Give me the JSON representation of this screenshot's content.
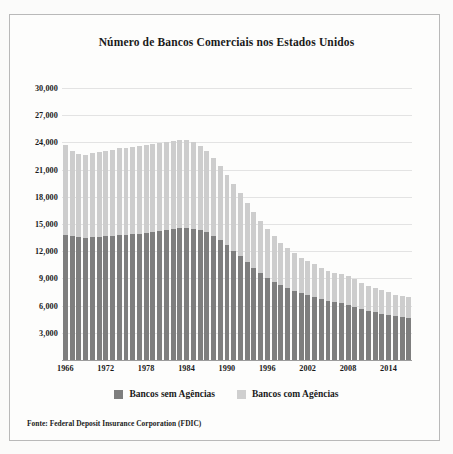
{
  "chart_data": {
    "type": "bar",
    "stacked": true,
    "title": "Número de Bancos Comerciais nos Estados Unidos",
    "xlabel": "",
    "ylabel": "",
    "ylim": [
      0,
      30000
    ],
    "ytick_labels": [
      "30,000",
      "27,000",
      "24,000",
      "21,000",
      "18,000",
      "15,000",
      "12,000",
      "9,000",
      "6,000",
      "3,000"
    ],
    "ytick_values": [
      30000,
      27000,
      24000,
      21000,
      18000,
      15000,
      12000,
      9000,
      6000,
      3000
    ],
    "xtick_labels": [
      "1966",
      "1972",
      "1978",
      "1984",
      "1990",
      "1996",
      "2002",
      "2008",
      "2014"
    ],
    "xtick_values": [
      1966,
      1972,
      1978,
      1984,
      1990,
      1996,
      2002,
      2008,
      2014
    ],
    "grid": true,
    "legend_position": "bottom",
    "categories": [
      1966,
      1967,
      1968,
      1969,
      1970,
      1971,
      1972,
      1973,
      1974,
      1975,
      1976,
      1977,
      1978,
      1979,
      1980,
      1981,
      1982,
      1983,
      1984,
      1985,
      1986,
      1987,
      1988,
      1989,
      1990,
      1991,
      1992,
      1993,
      1994,
      1995,
      1996,
      1997,
      1998,
      1999,
      2000,
      2001,
      2002,
      2003,
      2004,
      2005,
      2006,
      2007,
      2008,
      2009,
      2010,
      2011,
      2012,
      2013,
      2014,
      2015,
      2016,
      2017
    ],
    "series": [
      {
        "name": "Bancos sem Agências",
        "color": "#7e7e7e",
        "values": [
          13800,
          13650,
          13550,
          13500,
          13550,
          13600,
          13650,
          13700,
          13750,
          13800,
          13850,
          13900,
          14000,
          14100,
          14200,
          14300,
          14450,
          14550,
          14600,
          14500,
          14350,
          14100,
          13700,
          13200,
          12650,
          12050,
          11450,
          10800,
          10200,
          9600,
          9100,
          8650,
          8250,
          7900,
          7600,
          7350,
          7150,
          6950,
          6750,
          6550,
          6400,
          6250,
          6100,
          5850,
          5600,
          5400,
          5250,
          5100,
          4950,
          4800,
          4700,
          4600
        ]
      },
      {
        "name": "Bancos com Agências",
        "color": "#cdcdcd",
        "values": [
          9900,
          9450,
          9200,
          9150,
          9250,
          9350,
          9450,
          9500,
          9600,
          9600,
          9700,
          9750,
          9750,
          9700,
          9700,
          9750,
          9750,
          9750,
          9700,
          9500,
          9300,
          9000,
          8600,
          8200,
          7800,
          7400,
          7000,
          6550,
          6100,
          5750,
          5350,
          5000,
          4700,
          4400,
          4150,
          3950,
          3750,
          3600,
          3450,
          3300,
          3250,
          3200,
          3150,
          3050,
          2900,
          2800,
          2700,
          2600,
          2500,
          2400,
          2350,
          2300
        ]
      }
    ],
    "totals": [
      23700,
      23100,
      22750,
      22650,
      22800,
      22950,
      23100,
      23200,
      23350,
      23400,
      23550,
      23650,
      23750,
      23800,
      23900,
      24050,
      24200,
      24300,
      24300,
      24000,
      23650,
      23100,
      22300,
      21400,
      20450,
      19450,
      18450,
      17350,
      16300,
      15350,
      14450,
      13650,
      12950,
      12300,
      11750,
      11300,
      10900,
      10550,
      10200,
      9850,
      9650,
      9450,
      9250,
      8900,
      8500,
      8200,
      7950,
      7700,
      7450,
      7200,
      7050,
      6900
    ]
  },
  "legend": {
    "items": [
      {
        "label": "Bancos sem Agências",
        "swatch": "dark"
      },
      {
        "label": "Bancos com Agências",
        "swatch": "light"
      }
    ]
  },
  "source": {
    "text": "Fonte: Federal Deposit Insurance Corporation (FDIC)"
  },
  "colors": {
    "dark_gray": "#7e7e7e",
    "light_gray": "#cdcdcd",
    "gridline": "#e3e3e3",
    "text": "#1a1a1a",
    "frame": "#b9b9b9"
  }
}
